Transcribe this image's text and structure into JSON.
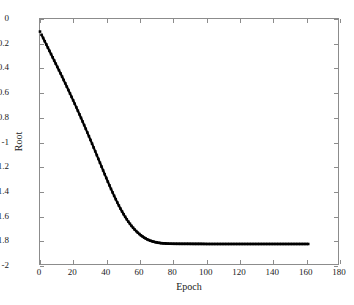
{
  "figure": {
    "background_color": "#ffffff",
    "axis_color": "#8c8c8c",
    "series_color": "#000000"
  },
  "axes": {
    "xlabel": "Epoch",
    "ylabel": "Root",
    "xticklabels": [
      "0",
      "20",
      "40",
      "60",
      "80",
      "100",
      "120",
      "140",
      "160",
      "180"
    ],
    "yticklabels": [
      "0",
      "-0.2",
      "-0.4",
      "-0.6",
      "-0.8",
      "-1",
      "-1.2",
      "-1.4",
      "-1.6",
      "-1.8",
      "-2"
    ]
  },
  "chart_data": {
    "type": "line",
    "title": "",
    "xlabel": "Epoch",
    "ylabel": "Root",
    "xlim": [
      0,
      180
    ],
    "ylim": [
      -2,
      0
    ],
    "xticks": [
      0,
      20,
      40,
      60,
      80,
      100,
      120,
      140,
      160,
      180
    ],
    "yticks": [
      0,
      -0.2,
      -0.4,
      -0.6,
      -0.8,
      -1,
      -1.2,
      -1.4,
      -1.6,
      -1.8,
      -2
    ],
    "grid": false,
    "legend": null,
    "marker": "square",
    "line_color": "#000000",
    "series": [
      {
        "name": "Root",
        "x": [
          1,
          3,
          5,
          7,
          9,
          11,
          13,
          15,
          17,
          19,
          21,
          23,
          25,
          27,
          29,
          31,
          33,
          35,
          37,
          39,
          41,
          43,
          45,
          47,
          49,
          51,
          53,
          55,
          57,
          59,
          61,
          63,
          65,
          67,
          69,
          71,
          73,
          75,
          77,
          79,
          81,
          85,
          89,
          93,
          97,
          101,
          105,
          109,
          113,
          117,
          121,
          125,
          129,
          133,
          137,
          141,
          145,
          149,
          153,
          157,
          161,
          162
        ],
        "y": [
          -0.13,
          -0.185,
          -0.24,
          -0.295,
          -0.35,
          -0.405,
          -0.46,
          -0.517,
          -0.575,
          -0.633,
          -0.692,
          -0.752,
          -0.813,
          -0.875,
          -0.938,
          -1.002,
          -1.067,
          -1.132,
          -1.198,
          -1.263,
          -1.327,
          -1.389,
          -1.448,
          -1.504,
          -1.556,
          -1.603,
          -1.645,
          -1.682,
          -1.714,
          -1.741,
          -1.764,
          -1.783,
          -1.798,
          -1.809,
          -1.817,
          -1.823,
          -1.827,
          -1.829,
          -1.831,
          -1.832,
          -1.8325,
          -1.833,
          -1.833,
          -1.8335,
          -1.8335,
          -1.834,
          -1.834,
          -1.834,
          -1.834,
          -1.834,
          -1.834,
          -1.834,
          -1.834,
          -1.834,
          -1.834,
          -1.834,
          -1.834,
          -1.834,
          -1.834,
          -1.834,
          -1.834,
          -1.834
        ]
      }
    ]
  }
}
